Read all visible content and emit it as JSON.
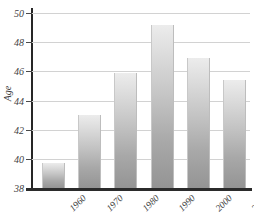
{
  "chart_data": {
    "type": "bar",
    "title": "",
    "xlabel": "",
    "ylabel": "Age",
    "categories": [
      "1960",
      "1970",
      "1980",
      "1990",
      "2000",
      "2002"
    ],
    "values": [
      39.7,
      43.0,
      45.9,
      49.2,
      46.9,
      45.4
    ],
    "ylim": [
      38,
      50
    ],
    "yticks": [
      38,
      40,
      42,
      44,
      46,
      48,
      50
    ],
    "ytick_labels": [
      "38",
      "40",
      "42",
      "44",
      "46",
      "48",
      "50"
    ],
    "grid": true,
    "legend": false,
    "bar_color_top": "#ececec",
    "bar_color_bottom": "#949494",
    "gridline_color": "#d2d2d2",
    "axis_color": "#262626"
  },
  "axes": {
    "y_title": "Age"
  }
}
